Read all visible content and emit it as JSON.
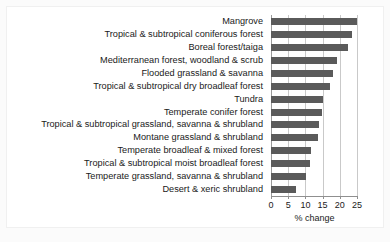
{
  "chart_data": {
    "type": "bar",
    "orientation": "horizontal",
    "title": "",
    "xlabel": "% change",
    "ylabel": "",
    "xlim": [
      0,
      25
    ],
    "xticks": [
      0,
      5,
      10,
      15,
      20,
      25
    ],
    "xtick_labels": [
      "0",
      "5",
      "10",
      "15",
      "20",
      "25"
    ],
    "grid": true,
    "grid_axis": "x",
    "legend": false,
    "bar_color": "#5a5a5a",
    "background_color": "#ffffff",
    "categories": [
      "Mangrove",
      "Tropical & subtropical coniferous forest",
      "Boreal forest/taiga",
      "Mediterranean forest, woodland & scrub",
      "Flooded grassland & savanna",
      "Tropical & subtropical dry broadleaf forest",
      "Tundra",
      "Temperate conifer forest",
      "Tropical & subtropical grassland, savanna & shrubland",
      "Montane grassland & shrubland",
      "Temperate broadleaf & mixed forest",
      "Tropical & subtropical moist broadleaf forest",
      "Temperate grassland, savanna & shrubland",
      "Desert & xeric shrubland"
    ],
    "values": [
      25.0,
      23.5,
      22.3,
      19.2,
      18.0,
      17.2,
      15.2,
      14.9,
      14.0,
      13.8,
      11.6,
      11.3,
      10.1,
      7.2
    ]
  }
}
